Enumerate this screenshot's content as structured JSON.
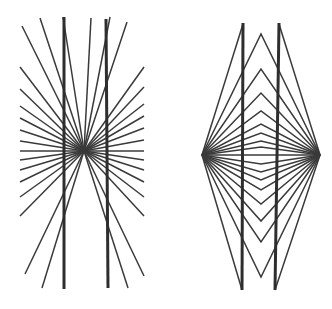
{
  "canvas": {
    "width": 332,
    "height": 309,
    "background": "#ffffff"
  },
  "style": {
    "ray_color": "#3a3a3a",
    "ray_width": 1.5,
    "bar_color": "#2e2e2e",
    "bar_width": 3
  },
  "hering": {
    "center": [
      84,
      151
    ],
    "ray_ends": [
      [
        22,
        26
      ],
      [
        40,
        18
      ],
      [
        63,
        17
      ],
      [
        91,
        18
      ],
      [
        110,
        17
      ],
      [
        127,
        22
      ],
      [
        20,
        67
      ],
      [
        20,
        89
      ],
      [
        20,
        106
      ],
      [
        20,
        118
      ],
      [
        20,
        130
      ],
      [
        20,
        141
      ],
      [
        20,
        151
      ],
      [
        144,
        67
      ],
      [
        144,
        87
      ],
      [
        144,
        104
      ],
      [
        144,
        116
      ],
      [
        144,
        128
      ],
      [
        144,
        140
      ],
      [
        144,
        151
      ],
      [
        20,
        160
      ],
      [
        20,
        170
      ],
      [
        20,
        182
      ],
      [
        20,
        197
      ],
      [
        20,
        216
      ],
      [
        25,
        274
      ],
      [
        42,
        288
      ],
      [
        144,
        160
      ],
      [
        144,
        170
      ],
      [
        144,
        182
      ],
      [
        144,
        197
      ],
      [
        144,
        216
      ],
      [
        144,
        276
      ],
      [
        128,
        288
      ]
    ],
    "bars": [
      {
        "x1": 64,
        "y1": 17,
        "x2": 64,
        "y2": 289
      },
      {
        "x1": 106,
        "y1": 19,
        "x2": 108,
        "y2": 288
      }
    ]
  },
  "wundt": {
    "left_vertex": [
      202,
      155
    ],
    "right_vertex": [
      320,
      155
    ],
    "apex_x": 261,
    "chevrons_top_y": [
      34,
      69,
      93,
      111,
      124,
      133,
      141,
      147
    ],
    "chevrons_bottom_y": [
      164,
      172,
      180,
      190,
      204,
      221,
      242,
      277
    ],
    "outer_top_left": [
      243,
      24
    ],
    "outer_top_right": [
      279,
      24
    ],
    "outer_bottom_left": [
      242,
      290
    ],
    "outer_bottom_right": [
      275,
      290
    ],
    "bars": [
      {
        "x1": 243,
        "y1": 23,
        "x2": 242,
        "y2": 290
      },
      {
        "x1": 279,
        "y1": 23,
        "x2": 275,
        "y2": 290
      }
    ]
  }
}
